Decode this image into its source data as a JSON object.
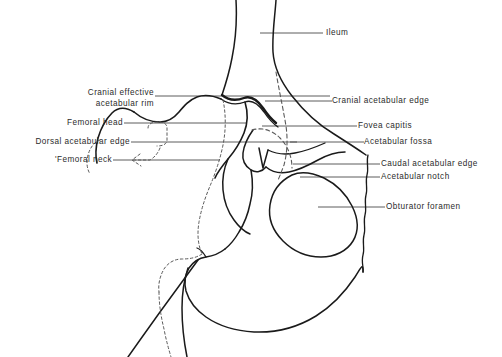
{
  "figure": {
    "background_color": "#ffffff",
    "ink_color": "#1a1a1a",
    "leader_color": "#4a4a4a",
    "text_color": "#2b2b2b"
  },
  "labels": {
    "ileum": "Ileum",
    "cranial_effective_rim_line1": "Cranial effective",
    "cranial_effective_rim_line2": "acetabular rim",
    "femoral_head": "Femoral head",
    "dorsal_acetabular_edge": "Dorsal acetabular edge",
    "femoral_neck": "'Femoral neck",
    "cranial_acetabular_edge": "Cranial acetabular edge",
    "fovea_capitis": "Fovea capitis",
    "acetabular_fossa": "Acetabular fossa",
    "caudal_acetabular_edge": "Caudal acetabular edge",
    "acetabular_notch": "Acetabular notch",
    "obturator_foramen": "Obturator foramen"
  }
}
